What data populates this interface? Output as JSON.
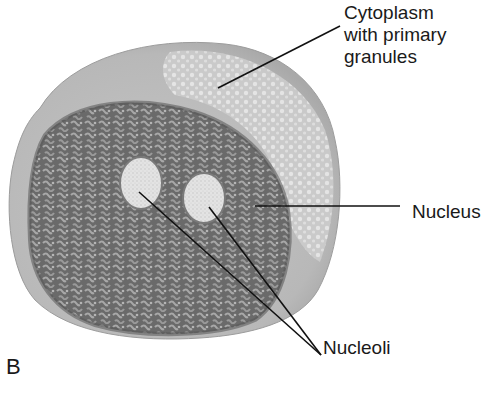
{
  "figure": {
    "panel_letter": "B",
    "labels": {
      "cytoplasm": [
        "Cytoplasm",
        "with primary",
        "granules"
      ],
      "nucleus": "Nucleus",
      "nucleoli": "Nucleoli"
    },
    "colors": {
      "background": "#ffffff",
      "cytoplasm": "#bdbdbd",
      "cytoplasm_granular": "#d6d6d6",
      "nucleus": "#6e6e6e",
      "nucleus_rim": "#5a5a5a",
      "nucleolus": "#e2e2e2",
      "leader_line": "#111111",
      "text": "#1a1a1a"
    }
  }
}
